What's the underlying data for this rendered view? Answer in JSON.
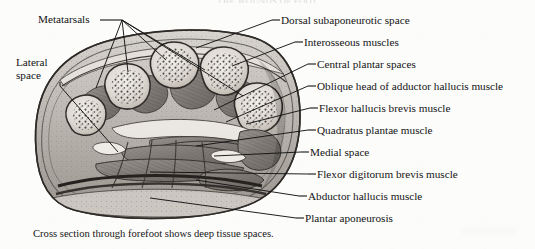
{
  "page": {
    "running_head": "THE WOUNDS OF FOOT",
    "caption": "Cross section through forefoot shows deep tissue spaces.",
    "background_color": "#fcfcfb",
    "ink_color": "#141414"
  },
  "figure": {
    "name": "cross-section-forefoot",
    "style": "grayscale engraved anatomical illustration"
  },
  "labels_left": [
    {
      "id": "metatarsals",
      "text": "Metatarsals",
      "x": 38,
      "y": 13,
      "leader_origin": {
        "x": 122,
        "y": 20
      },
      "targets": [
        {
          "x": 96,
          "y": 88
        },
        {
          "x": 128,
          "y": 72
        },
        {
          "x": 166,
          "y": 60
        },
        {
          "x": 205,
          "y": 70
        },
        {
          "x": 243,
          "y": 96
        }
      ]
    },
    {
      "id": "lateral-space",
      "text": "Lateral space",
      "x": 16,
      "y": 56,
      "two_line": true,
      "leader_origin": {
        "x": 60,
        "y": 86
      },
      "targets": [
        {
          "x": 118,
          "y": 152
        }
      ]
    }
  ],
  "labels_right": [
    {
      "id": "dorsal-subaponeurotic-space",
      "text": "Dorsal subaponeurotic space",
      "y": 20,
      "dash_x": 272,
      "text_x": 281,
      "target": {
        "x": 196,
        "y": 48
      }
    },
    {
      "id": "interosseous-muscles",
      "text": "Interosseous muscles",
      "y": 42,
      "dash_x": 295,
      "text_x": 304,
      "target": {
        "x": 232,
        "y": 66
      }
    },
    {
      "id": "central-plantar-spaces",
      "text": "Central plantar spaces",
      "y": 64,
      "dash_x": 308,
      "text_x": 317,
      "target": {
        "x": 214,
        "y": 110
      }
    },
    {
      "id": "oblique-head-adductor-hallucis",
      "text": "Oblique head of adductor hallucis muscle",
      "y": 86,
      "dash_x": 308,
      "text_x": 317,
      "target": {
        "x": 226,
        "y": 122
      }
    },
    {
      "id": "flexor-hallucis-brevis-muscle",
      "text": "Flexor hallucis brevis muscle",
      "y": 108,
      "dash_x": 310,
      "text_x": 319,
      "target": {
        "x": 246,
        "y": 124
      }
    },
    {
      "id": "quadratus-plantae-muscle",
      "text": "Quadratus plantae muscle",
      "y": 130,
      "dash_x": 308,
      "text_x": 317,
      "target": {
        "x": 196,
        "y": 146
      }
    },
    {
      "id": "medial-space",
      "text": "Medial space",
      "y": 152,
      "dash_x": 301,
      "text_x": 310,
      "target": {
        "x": 214,
        "y": 156
      }
    },
    {
      "id": "flexor-digitorum-brevis-muscle",
      "text": "Flexor digitorum brevis muscle",
      "y": 174,
      "dash_x": 308,
      "text_x": 317,
      "target": {
        "x": 150,
        "y": 172
      }
    },
    {
      "id": "abductor-hallucis-muscle",
      "text": "Abductor hallucis muscle",
      "y": 196,
      "dash_x": 299,
      "text_x": 308,
      "target": {
        "x": 196,
        "y": 180
      }
    },
    {
      "id": "plantar-aponeurosis",
      "text": "Plantar aponeurosis",
      "y": 218,
      "dash_x": 296,
      "text_x": 305,
      "target": {
        "x": 150,
        "y": 198
      }
    }
  ]
}
